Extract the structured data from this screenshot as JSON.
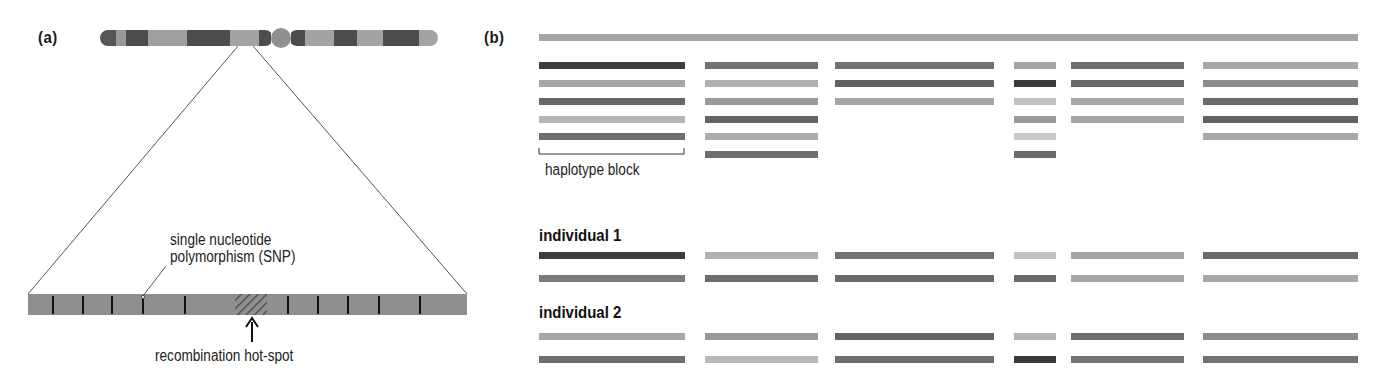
{
  "panel_a": {
    "label": "(a)",
    "snp_label_line1": "single nucleotide",
    "snp_label_line2": "polymorphism (SNP)",
    "hotspot_label": "recombination hot-spot",
    "chromosome": {
      "x_start": 100,
      "x_end": 438,
      "y": 30,
      "height": 16,
      "centromere_x": 281,
      "bands": [
        {
          "x": 100,
          "w": 16,
          "color": "#555555"
        },
        {
          "x": 116,
          "w": 10,
          "color": "#9a9a9a"
        },
        {
          "x": 126,
          "w": 22,
          "color": "#4d4d4d"
        },
        {
          "x": 148,
          "w": 39,
          "color": "#9f9f9f"
        },
        {
          "x": 187,
          "w": 43,
          "color": "#4d4d4d"
        },
        {
          "x": 230,
          "w": 29,
          "color": "#a3a3a3"
        },
        {
          "x": 259,
          "w": 12,
          "color": "#4d4d4d"
        },
        {
          "x": 291,
          "w": 14,
          "color": "#4d4d4d"
        },
        {
          "x": 305,
          "w": 29,
          "color": "#a3a3a3"
        },
        {
          "x": 334,
          "w": 23,
          "color": "#4d4d4d"
        },
        {
          "x": 357,
          "w": 26,
          "color": "#a3a3a3"
        },
        {
          "x": 383,
          "w": 36,
          "color": "#4d4d4d"
        },
        {
          "x": 419,
          "w": 19,
          "color": "#a3a3a3"
        }
      ]
    },
    "dna_strip": {
      "x": 28,
      "y": 294,
      "w": 439,
      "h": 21,
      "color": "#8f8f8f"
    },
    "snp_positions": [
      53,
      83,
      112,
      143,
      185,
      288,
      318,
      348,
      379,
      420
    ],
    "hotspot": {
      "x": 235,
      "w": 32
    }
  },
  "panel_b": {
    "label": "(b)",
    "haplotype_block_label": "haplotype block",
    "reference_bar": {
      "x": 539,
      "w": 819,
      "y": 34,
      "color": "#a6a6a6"
    },
    "columns": [
      {
        "x": 539,
        "w": 146,
        "rows": [
          "#3e3e3e",
          "#a6a6a6",
          "#686868",
          "#b4b4b4",
          "#6e6e6e"
        ]
      },
      {
        "x": 705,
        "w": 113,
        "rows": [
          "#727272",
          "#b0b0b0",
          "#9a9a9a",
          "#636363",
          "#adadad",
          "#6e6e6e"
        ]
      },
      {
        "x": 835,
        "w": 159,
        "rows": [
          "#727272",
          "#626262",
          "#a6a6a6"
        ]
      },
      {
        "x": 1014,
        "w": 42,
        "rows": [
          "#a4a4a4",
          "#3a3a3a",
          "#c2c2c2",
          "#9c9c9c",
          "#cacaca",
          "#6a6a6a"
        ]
      },
      {
        "x": 1071,
        "w": 113,
        "rows": [
          "#6e6e6e",
          "#6a6a6a",
          "#a8a8a8",
          "#a4a4a4"
        ]
      },
      {
        "x": 1203,
        "w": 155,
        "rows": [
          "#a9a9a9",
          "#8c8c8c",
          "#6a6a6a",
          "#616161",
          "#a8a8a8"
        ]
      }
    ],
    "row_y": [
      62,
      80,
      98,
      116,
      133,
      151
    ],
    "individuals": [
      {
        "label": "individual 1",
        "label_y": 227,
        "rows": [
          {
            "y": 252,
            "colors": [
              "#3e3e3e",
              "#b0b0b0",
              "#727272",
              "#c2c2c2",
              "#a4a4a4",
              "#6a6a6a"
            ]
          },
          {
            "y": 275,
            "colors": [
              "#7a7a7a",
              "#6e6e6e",
              "#6a6a6a",
              "#6a6a6a",
              "#a6a6a6",
              "#a9a9a9"
            ]
          }
        ]
      },
      {
        "label": "individual 2",
        "label_y": 304,
        "rows": [
          {
            "y": 333,
            "colors": [
              "#a6a6a6",
              "#9a9a9a",
              "#626262",
              "#b4b4b4",
              "#6e6e6e",
              "#8c8c8c"
            ]
          },
          {
            "y": 356,
            "colors": [
              "#6e6e6e",
              "#b8b8b8",
              "#6e6e6e",
              "#3a3a3a",
              "#727272",
              "#727272"
            ]
          }
        ]
      }
    ]
  }
}
